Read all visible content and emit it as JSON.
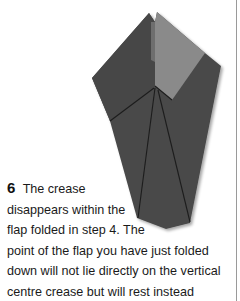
{
  "step": {
    "number": "6",
    "caption_lines": [
      "The crease",
      "disappears within the",
      "flap folded in step 4. The",
      "point of the flap you have just folded",
      "down will not lie directly on the vertical",
      "centre crease but will rest instead"
    ]
  },
  "illustration": {
    "subject": "origami fold diagram",
    "colors": {
      "paper_dark": "#4a4a4a",
      "paper_flap": "#8a8a8a",
      "paper_flap_shadow": "#6e6e6e",
      "crease": "#1c1c1c"
    }
  }
}
